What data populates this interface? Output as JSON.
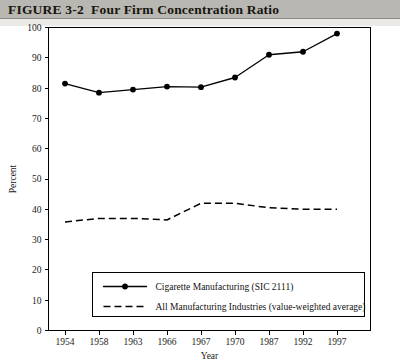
{
  "header": {
    "figure_number": "FIGURE 3-2",
    "title": "Four Firm Concentration Ratio",
    "full_title": "FIGURE 3-2  Four Firm Concentration Ratio",
    "band_color": "#b9b7b2"
  },
  "chart_data": {
    "type": "line",
    "title": "Four Firm Concentration Ratio",
    "xlabel": "Year",
    "ylabel": "Percent",
    "categories": [
      "1954",
      "1958",
      "1963",
      "1966",
      "1967",
      "1970",
      "1987",
      "1992",
      "1997"
    ],
    "x": [
      1954,
      1958,
      1963,
      1966,
      1967,
      1970,
      1987,
      1992,
      1997
    ],
    "ylim": [
      0,
      100
    ],
    "ytick_step": 10,
    "yticks": [
      "0",
      "10",
      "20",
      "30",
      "40",
      "50",
      "60",
      "70",
      "80",
      "90",
      "100"
    ],
    "grid": false,
    "legend_position": "bottom-center",
    "series": [
      {
        "name": "Cigarette Manufacturing (SIC 2111)",
        "style": "solid",
        "markers": true,
        "color": "#000000",
        "values": [
          81.5,
          78.5,
          79.5,
          80.5,
          80.3,
          83.5,
          91.0,
          92.0,
          98.0
        ]
      },
      {
        "name": "All Manufacturing Industries (value-weighted average)",
        "style": "dashed",
        "markers": false,
        "color": "#000000",
        "values": [
          35.8,
          37.0,
          37.0,
          36.5,
          42.0,
          42.0,
          40.5,
          40.0,
          40.0
        ]
      }
    ]
  },
  "legend": {
    "items": [
      {
        "label": "Cigarette Manufacturing (SIC 2111)",
        "style": "solid"
      },
      {
        "label": "All Manufacturing Industries (value-weighted average)",
        "style": "dashed"
      }
    ]
  }
}
